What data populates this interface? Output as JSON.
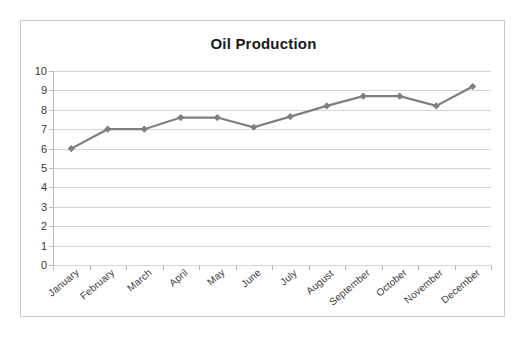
{
  "chart_data": {
    "type": "line",
    "title": "Oil Production",
    "xlabel": "",
    "ylabel": "",
    "categories": [
      "January",
      "February",
      "March",
      "April",
      "May",
      "June",
      "July",
      "August",
      "September",
      "October",
      "November",
      "December"
    ],
    "values": [
      6.0,
      7.0,
      7.0,
      7.6,
      7.6,
      7.1,
      7.65,
      8.2,
      8.7,
      8.7,
      8.2,
      9.2
    ],
    "series": [
      {
        "name": "Oil Production",
        "values": [
          6.0,
          7.0,
          7.0,
          7.6,
          7.6,
          7.1,
          7.65,
          8.2,
          8.7,
          8.7,
          8.2,
          9.2
        ]
      }
    ],
    "ylim": [
      0,
      10
    ],
    "ytick_values": [
      0,
      1,
      2,
      3,
      4,
      5,
      6,
      7,
      8,
      9,
      10
    ],
    "ytick_labels": [
      "0",
      "1",
      "2",
      "3",
      "4",
      "5",
      "6",
      "7",
      "8",
      "9",
      "10"
    ],
    "grid": true,
    "legend": false,
    "legend_position": "none",
    "marker": "diamond",
    "series_color": "#7f7f7f",
    "gridline_color": "#d6d6d6",
    "axis_color": "#b8b8b8",
    "border_color": "#c9c9c9",
    "title_color": "#1a1a1a",
    "tick_label_color": "#3a3a3a",
    "x_label_rotation": -40
  }
}
